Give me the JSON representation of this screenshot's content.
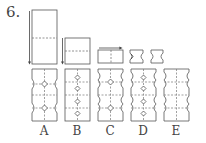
{
  "question": {
    "number": "6."
  },
  "fold_steps": [
    {
      "id": "step-1",
      "shape": "tall-rectangle",
      "fold": "horizontal-middle",
      "arrow": "down-left"
    },
    {
      "id": "step-2",
      "shape": "square",
      "fold": "horizontal-middle",
      "arrow": "down-left"
    },
    {
      "id": "step-3",
      "shape": "wide-rectangle",
      "fold": "vertical-middle",
      "arrow": "top-right"
    },
    {
      "id": "step-4",
      "shape": "notched-cut",
      "note": "cut notches on both sides"
    },
    {
      "id": "step-5",
      "shape": "notched-result"
    }
  ],
  "options": [
    {
      "label": "A",
      "pattern": "round-notches-2-diamonds"
    },
    {
      "label": "B",
      "pattern": "straight-4-diamonds"
    },
    {
      "label": "C",
      "pattern": "wavy-2-diamonds"
    },
    {
      "label": "D",
      "pattern": "wavy-4-diamonds"
    },
    {
      "label": "E",
      "pattern": "wavy-no-diamonds"
    }
  ],
  "colors": {
    "line": "#555555",
    "dash": "#777777"
  }
}
